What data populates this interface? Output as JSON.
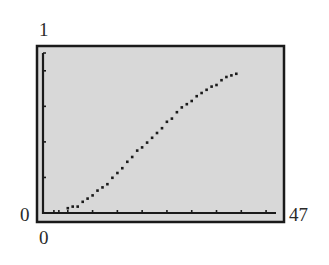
{
  "window_labels": {
    "ymax": "1",
    "ymin": "0",
    "xmin": "0",
    "xmax": "47"
  },
  "colors": {
    "screen_bg": "#d8d8d8",
    "frame": "#1a1a1a",
    "axis": "#1a1a1a",
    "points": "#1a1a1a"
  },
  "chart_data": {
    "type": "scatter",
    "title": "",
    "xlabel": "",
    "ylabel": "",
    "xlim": [
      0,
      47
    ],
    "ylim": [
      0,
      1
    ],
    "grid": false,
    "legend": null,
    "x_ticks_count": 10,
    "y_ticks_count": 4,
    "series": [
      {
        "name": "data",
        "x": [
          5,
          6,
          7,
          8,
          9,
          10,
          11,
          12,
          13,
          14,
          15,
          16,
          17,
          18,
          19,
          20,
          21,
          22,
          23,
          24,
          25,
          26,
          27,
          28,
          29,
          30,
          31,
          32,
          33,
          34,
          35,
          36,
          37,
          38,
          39
        ],
        "y": [
          0.03,
          0.04,
          0.04,
          0.07,
          0.09,
          0.11,
          0.14,
          0.16,
          0.18,
          0.22,
          0.25,
          0.28,
          0.32,
          0.35,
          0.39,
          0.41,
          0.44,
          0.47,
          0.5,
          0.53,
          0.57,
          0.59,
          0.63,
          0.66,
          0.68,
          0.7,
          0.73,
          0.75,
          0.77,
          0.79,
          0.8,
          0.83,
          0.85,
          0.86,
          0.87
        ]
      }
    ]
  }
}
